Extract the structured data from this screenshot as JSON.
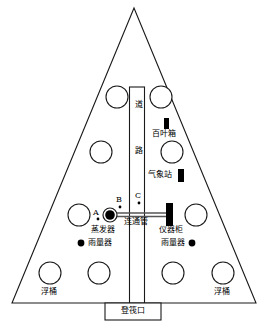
{
  "diagram": {
    "colors": {
      "outline": "#1a1a1a",
      "fill": "#ffffff",
      "marker": "#000000"
    },
    "road": {
      "label_chars": [
        "道",
        "路"
      ],
      "label_top": "道",
      "label_bottom": "路"
    },
    "instruments": {
      "stevenson_screen": "百叶箱",
      "weather_station": "气象站",
      "evaporator": "蒸发器",
      "connecting_pipe": "连通管",
      "instrument_cabinet": "仪器柜",
      "rain_gauge_left": "雨量器",
      "rain_gauge_right": "雨量器"
    },
    "points": {
      "a": "A",
      "b": "B",
      "c": "C"
    },
    "floats": {
      "label_left": "浮桶",
      "label_right": "浮桶"
    },
    "entrance": {
      "label": "登筏口"
    }
  }
}
